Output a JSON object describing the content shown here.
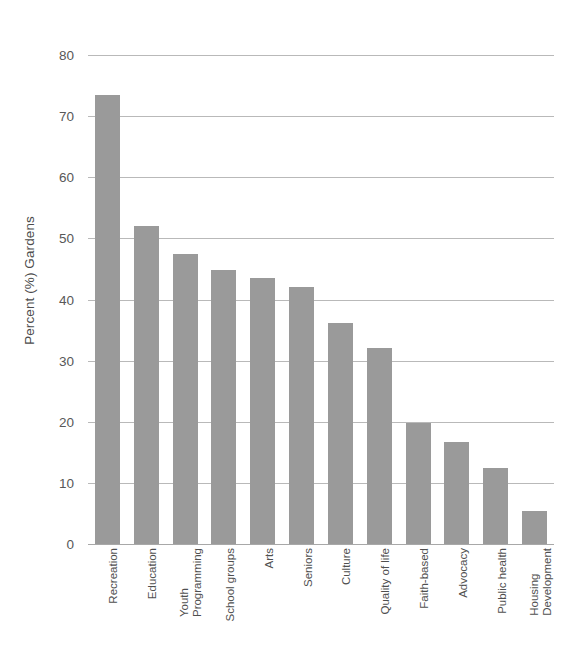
{
  "chart_data": {
    "type": "bar",
    "title": "",
    "subtitle": "",
    "xlabel": "",
    "ylabel": "Percent (%) Gardens",
    "ylim": [
      0,
      80
    ],
    "yticks": [
      0,
      10,
      20,
      30,
      40,
      50,
      60,
      70,
      80
    ],
    "ytick_labels": [
      "0",
      "10",
      "20",
      "30",
      "40",
      "50",
      "60",
      "70",
      "80"
    ],
    "grid": "horizontal",
    "legend": "none",
    "bar_color": "#9a9a9a",
    "gridline_color": "#b9b9b9",
    "categories": [
      "Recreation",
      "Education",
      "Youth Programming",
      "School groups",
      "Arts",
      "Seniors",
      "Culture",
      "Quality of life",
      "Faith-based",
      "Advocacy",
      "Public health",
      "Housing Development"
    ],
    "category_lines": [
      [
        "Recreation"
      ],
      [
        "Education"
      ],
      [
        "Youth",
        "Programming"
      ],
      [
        "School groups"
      ],
      [
        "Arts"
      ],
      [
        "Seniors"
      ],
      [
        "Culture"
      ],
      [
        "Quality of life"
      ],
      [
        "Faith-based"
      ],
      [
        "Advocacy"
      ],
      [
        "Public health"
      ],
      [
        "Housing",
        "Development"
      ]
    ],
    "values": [
      73.5,
      52.0,
      47.5,
      44.8,
      43.5,
      42.0,
      36.2,
      32.1,
      19.8,
      16.7,
      12.5,
      5.4
    ]
  }
}
